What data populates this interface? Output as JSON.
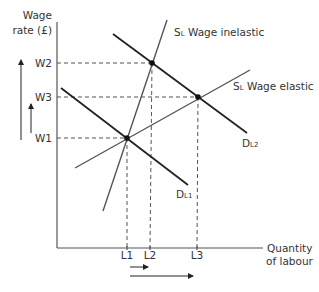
{
  "diagram": {
    "y_axis_label_line1": "Wage",
    "y_axis_label_line2": "rate (£)",
    "x_axis_label_line1": "Quantity",
    "x_axis_label_line2": "of labour",
    "y_ticks": [
      "W2",
      "W3",
      "W1"
    ],
    "x_ticks": [
      "L1",
      "L2",
      "L3"
    ],
    "curves": {
      "supply_inelastic": "SL Wage inelastic",
      "supply_elastic": "SL Wage elastic",
      "demand_1": "DL1",
      "demand_2": "DL2"
    },
    "labels": {
      "s_inelastic_sub": "S",
      "s_inelastic_subscript": "L",
      "s_inelastic_text": " Wage inelastic",
      "s_elastic_sub": "S",
      "s_elastic_subscript": "L",
      "s_elastic_text": " Wage elastic",
      "d1_main": "D",
      "d1_subscript": "L1",
      "d2_main": "D",
      "d2_subscript": "L2"
    },
    "equilibria": [
      {
        "name": "initial",
        "wage": "W1",
        "quantity": "L1"
      },
      {
        "name": "inelastic-supply",
        "wage": "W2",
        "quantity": "L2"
      },
      {
        "name": "elastic-supply",
        "wage": "W3",
        "quantity": "L3"
      }
    ]
  }
}
